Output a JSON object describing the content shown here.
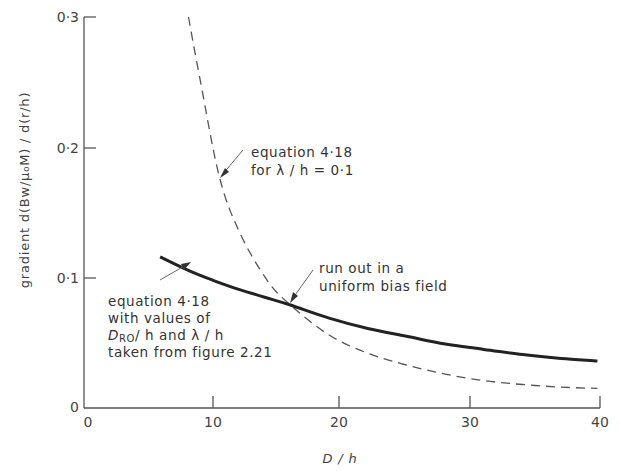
{
  "chart_data": {
    "type": "line",
    "title": "",
    "xlabel": "D / h",
    "ylabel": "gradient d(Bw/μ₀M) / d(r/h)",
    "xlim": [
      0,
      40
    ],
    "ylim": [
      0,
      0.3
    ],
    "x_ticks": [
      0,
      10,
      20,
      30,
      40
    ],
    "x_tick_labels": [
      "0",
      "10",
      "20",
      "30",
      "40"
    ],
    "y_ticks": [
      0,
      0.1,
      0.2,
      0.3
    ],
    "y_tick_labels": [
      "0",
      "0·1",
      "0·2",
      "0·3"
    ],
    "grid": false,
    "legend": "none (inline annotations)",
    "series": [
      {
        "name": "equation 4·18 with values of D_RO/h and λ/h taken from figure 2.21",
        "style": "solid-thick",
        "x": [
          5.9,
          8,
          10,
          12,
          14,
          16,
          19,
          22,
          25,
          28,
          31,
          34,
          37,
          39.8
        ],
        "y": [
          0.116,
          0.106,
          0.098,
          0.091,
          0.085,
          0.079,
          0.069,
          0.061,
          0.055,
          0.049,
          0.045,
          0.041,
          0.038,
          0.036
        ]
      },
      {
        "name": "equation 4·18 for λ/h = 0·1",
        "style": "dashed",
        "x": [
          8.1,
          9,
          10.5,
          12.1,
          14.2,
          16,
          19,
          22,
          25,
          28,
          31,
          34,
          37,
          39.8
        ],
        "y": [
          0.3,
          0.252,
          0.177,
          0.134,
          0.098,
          0.079,
          0.056,
          0.042,
          0.033,
          0.026,
          0.021,
          0.018,
          0.016,
          0.015
        ]
      }
    ],
    "annotations": [
      {
        "lines": [
          "equation 4·18",
          "for λ / h = 0·1"
        ],
        "points_to": "dashed curve near D/h≈10.5"
      },
      {
        "lines": [
          "equation 4·18",
          "with values of",
          "D_RO/ h and λ / h",
          "taken from figure 2.21"
        ],
        "points_to": "solid curve near D/h≈9"
      },
      {
        "lines": [
          "run out in a",
          "uniform bias field"
        ],
        "points_to": "intersection at D/h≈16, 0·08"
      }
    ]
  },
  "labels": {
    "x_axis_title": "D / h",
    "y_axis_title": "gradient d(Bw/μ₀M) / d(r/h)",
    "x_ticks": [
      "0",
      "10",
      "20",
      "30",
      "40"
    ],
    "y_ticks": [
      "0",
      "0·1",
      "0·2",
      "0·3"
    ],
    "annot_dashed_1": "equation 4·18",
    "annot_dashed_2": "for λ / h = 0·1",
    "annot_solid_1": "equation 4·18",
    "annot_solid_2": "with values of",
    "annot_solid_3a": "D",
    "annot_solid_3b": "RO",
    "annot_solid_3c": "/ h and λ / h",
    "annot_solid_4": "taken from figure 2.21",
    "annot_cross_1": "run out in a",
    "annot_cross_2": "uniform bias field"
  },
  "colors": {
    "axis": "#555555",
    "solid_curve": "#222222",
    "dashed_curve": "#555555",
    "text": "#333333"
  }
}
